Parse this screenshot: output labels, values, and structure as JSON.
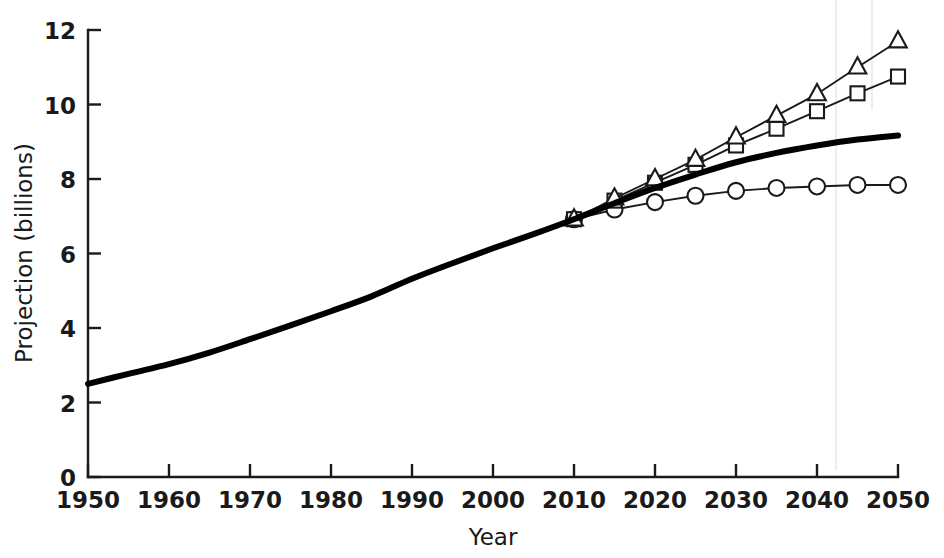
{
  "chart_data": {
    "type": "line",
    "title": "",
    "xlabel": "Year",
    "ylabel": "Projection (billions)",
    "xlim": [
      1950,
      2050
    ],
    "ylim": [
      0,
      12
    ],
    "grid": false,
    "legend_position": "none",
    "xticks": [
      "1950",
      "1960",
      "1970",
      "1980",
      "1990",
      "2000",
      "2010",
      "2020",
      "2030",
      "2040",
      "2050"
    ],
    "yticks": [
      "0",
      "2",
      "4",
      "6",
      "8",
      "10",
      "12"
    ],
    "series": [
      {
        "name": "Medium projection",
        "marker": "none",
        "style": "thick-solid",
        "x": [
          1950,
          1955,
          1960,
          1965,
          1970,
          1975,
          1980,
          1985,
          1990,
          1995,
          2000,
          2005,
          2010,
          2015,
          2020,
          2025,
          2030,
          2035,
          2040,
          2045,
          2050
        ],
        "values": [
          2.5,
          2.77,
          3.03,
          3.34,
          3.7,
          4.07,
          4.45,
          4.85,
          5.32,
          5.74,
          6.14,
          6.52,
          6.92,
          7.35,
          7.76,
          8.12,
          8.45,
          8.7,
          8.9,
          9.06,
          9.17
        ]
      },
      {
        "name": "High variant",
        "marker": "triangle",
        "style": "thin-solid",
        "x": [
          2010,
          2015,
          2020,
          2025,
          2030,
          2035,
          2040,
          2045,
          2050
        ],
        "values": [
          6.92,
          7.48,
          8.0,
          8.52,
          9.12,
          9.7,
          10.28,
          11.0,
          11.7
        ]
      },
      {
        "name": "Medium-high variant",
        "marker": "square",
        "style": "thin-solid",
        "x": [
          2010,
          2015,
          2020,
          2025,
          2030,
          2035,
          2040,
          2045,
          2050
        ],
        "values": [
          6.92,
          7.42,
          7.9,
          8.38,
          8.9,
          9.35,
          9.82,
          10.3,
          10.75
        ]
      },
      {
        "name": "Low variant",
        "marker": "circle",
        "style": "thin-solid",
        "x": [
          2010,
          2015,
          2020,
          2025,
          2030,
          2035,
          2040,
          2045,
          2050
        ],
        "values": [
          6.92,
          7.18,
          7.38,
          7.55,
          7.68,
          7.76,
          7.8,
          7.84,
          7.84
        ]
      }
    ]
  },
  "axes": {
    "x_title": "Year",
    "y_title": "Projection (billions)"
  }
}
